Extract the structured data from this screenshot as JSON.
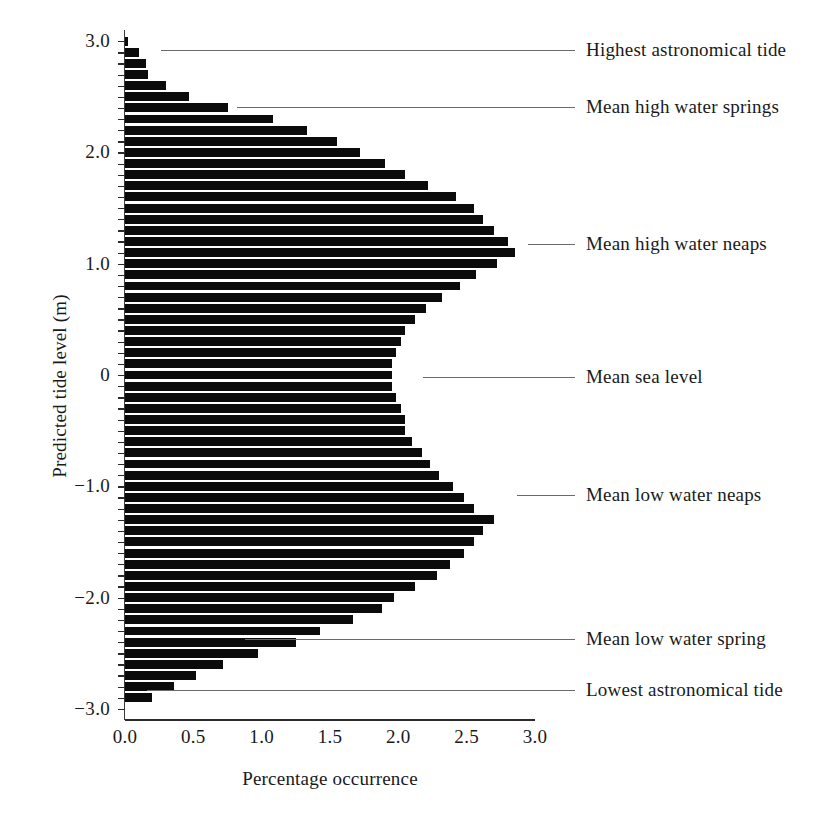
{
  "chart_data": {
    "type": "bar",
    "orientation": "horizontal",
    "title": "",
    "xlabel": "Percentage occurrence",
    "ylabel": "Predicted tide level (m)",
    "xlim": [
      0.0,
      3.0
    ],
    "ylim": [
      -3.1,
      3.1
    ],
    "grid": false,
    "legend": "none",
    "bar_color": "#0b0b0b",
    "xticks": [
      "0.0",
      "0.5",
      "1.0",
      "1.5",
      "2.0",
      "2.5",
      "3.0"
    ],
    "xtick_values": [
      0.0,
      0.5,
      1.0,
      1.5,
      2.0,
      2.5,
      3.0
    ],
    "yticks": [
      "3.0",
      "2.0",
      "1.0",
      "0",
      "-1.0",
      "-2.0",
      "-3.0"
    ],
    "ytick_values": [
      3.0,
      2.0,
      1.0,
      0,
      -1.0,
      -2.0,
      -3.0
    ],
    "bin_height": 0.1,
    "categories": [
      3.0,
      2.9,
      2.8,
      2.7,
      2.6,
      2.5,
      2.4,
      2.3,
      2.2,
      2.1,
      2.0,
      1.9,
      1.8,
      1.7,
      1.6,
      1.5,
      1.4,
      1.3,
      1.2,
      1.1,
      1.0,
      0.9,
      0.8,
      0.7,
      0.6,
      0.5,
      0.4,
      0.3,
      0.2,
      0.1,
      0.0,
      -0.1,
      -0.2,
      -0.3,
      -0.4,
      -0.5,
      -0.6,
      -0.7,
      -0.8,
      -0.9,
      -1.0,
      -1.1,
      -1.2,
      -1.3,
      -1.4,
      -1.5,
      -1.6,
      -1.7,
      -1.8,
      -1.9,
      -2.0,
      -2.1,
      -2.2,
      -2.3,
      -2.4,
      -2.5,
      -2.6,
      -2.7,
      -2.8,
      -2.9
    ],
    "values": [
      0.02,
      0.1,
      0.15,
      0.17,
      0.3,
      0.47,
      0.75,
      1.08,
      1.33,
      1.55,
      1.72,
      1.9,
      2.05,
      2.22,
      2.42,
      2.55,
      2.62,
      2.7,
      2.8,
      2.85,
      2.72,
      2.57,
      2.45,
      2.32,
      2.2,
      2.12,
      2.05,
      2.02,
      1.98,
      1.95,
      1.95,
      1.95,
      1.98,
      2.02,
      2.05,
      2.05,
      2.1,
      2.17,
      2.23,
      2.3,
      2.4,
      2.48,
      2.55,
      2.7,
      2.62,
      2.55,
      2.48,
      2.38,
      2.28,
      2.12,
      1.97,
      1.88,
      1.67,
      1.43,
      1.25,
      0.97,
      0.72,
      0.52,
      0.36,
      0.2
    ],
    "annotations": [
      {
        "label": "Highest astronomical tide",
        "level": 2.92,
        "line_start_x": 0.26
      },
      {
        "label": "Mean high water springs",
        "level": 2.41,
        "line_start_x": 0.82
      },
      {
        "label": "Mean high water neaps",
        "level": 1.18,
        "line_start_x": 2.95
      },
      {
        "label": "Mean sea level",
        "level": -0.02,
        "line_start_x": 2.18
      },
      {
        "label": "Mean low water neaps",
        "level": -1.08,
        "line_start_x": 2.87
      },
      {
        "label": "Mean  low water spring",
        "level": -2.37,
        "line_start_x": 0.88
      },
      {
        "label": "Lowest astronomical tide",
        "level": -2.83,
        "line_start_x": 0.16
      }
    ]
  },
  "axes": {
    "x_title": "Percentage occurrence",
    "y_title": "Predicted tide level (m)"
  }
}
